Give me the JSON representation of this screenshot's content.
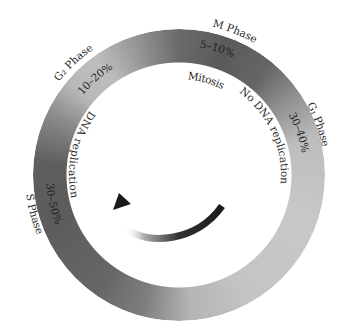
{
  "phases": [
    {
      "id": "m",
      "name": "M Phase",
      "percent": "5–10%",
      "description": "Mitosis"
    },
    {
      "id": "g1",
      "name": "G₁ Phase",
      "percent": "30–40%",
      "description": "No DNA replication"
    },
    {
      "id": "s",
      "name": "S Phase",
      "percent": "30–50%",
      "description": "DNA replication"
    },
    {
      "id": "g2",
      "name": "G₂ Phase",
      "percent": "10–20%",
      "description": ""
    }
  ],
  "direction_arrow": "counterclockwise-arrow-icon"
}
